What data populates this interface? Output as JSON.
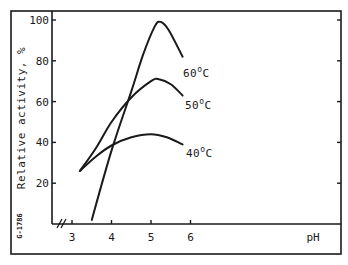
{
  "figure": {
    "id_label": "G-1786"
  },
  "chart_data": {
    "type": "line",
    "title": "",
    "xlabel": "pH",
    "ylabel": "Relative activity, %",
    "xlim": [
      2.5,
      8.3
    ],
    "ylim": [
      0,
      105
    ],
    "x_ticks": [
      3,
      4,
      5,
      6
    ],
    "x_tick_labels": [
      "3",
      "4",
      "5",
      "6"
    ],
    "y_ticks": [
      20,
      40,
      60,
      80,
      100
    ],
    "y_tick_labels": [
      "20",
      "40",
      "60",
      "80",
      "100"
    ],
    "x_axis_break": true,
    "grid": false,
    "legend": "inline labels at curve ends",
    "series": [
      {
        "name": "40°C",
        "label_text": "40",
        "label_unit": "C",
        "x": [
          3.2,
          3.6,
          4.0,
          4.5,
          5.0,
          5.4,
          5.8
        ],
        "y": [
          26,
          33,
          38.5,
          42.5,
          44,
          42.5,
          39
        ]
      },
      {
        "name": "50°C",
        "label_text": "50",
        "label_unit": "C",
        "x": [
          3.2,
          3.6,
          4.0,
          4.5,
          5.0,
          5.2,
          5.5,
          5.8
        ],
        "y": [
          26,
          37,
          50,
          62,
          70,
          71,
          68.5,
          63
        ]
      },
      {
        "name": "60°C",
        "label_text": "60",
        "label_unit": "C",
        "x": [
          3.5,
          4.0,
          4.5,
          4.8,
          5.1,
          5.25,
          5.45,
          5.8
        ],
        "y": [
          2,
          36,
          65,
          83,
          97,
          99,
          95,
          82
        ]
      }
    ]
  },
  "colors": {
    "ink": "#1a1a1a",
    "background": "#ffffff"
  }
}
